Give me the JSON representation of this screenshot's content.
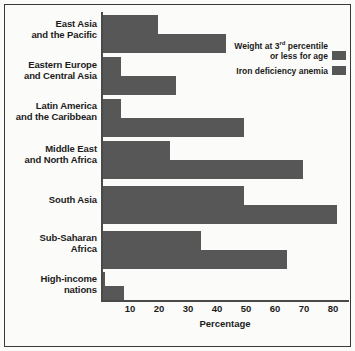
{
  "chart_data": {
    "type": "bar",
    "orientation": "horizontal",
    "title": "",
    "xlabel": "Percentage",
    "ylabel": "",
    "xlim": [
      0,
      80
    ],
    "xticks": [
      10,
      20,
      30,
      40,
      50,
      60,
      70,
      80
    ],
    "grid": false,
    "legend_position": "top-right",
    "bar_color": "#575757",
    "categories": [
      "East Asia and the Pacific",
      "Eastern Europe and Central Asia",
      "Latin America and the Caribbean",
      "Middle East and North Africa",
      "South Asia",
      "Sub-Saharan Africa",
      "High-income nations"
    ],
    "category_lines": [
      [
        "East Asia",
        "and the Pacific"
      ],
      [
        "Eastern Europe",
        "and Central Asia"
      ],
      [
        "Latin America",
        "and the Caribbean"
      ],
      [
        "Middle East",
        "and North Africa"
      ],
      [
        "South Asia"
      ],
      [
        "Sub-Saharan",
        "Africa"
      ],
      [
        "High-income",
        "nations"
      ]
    ],
    "series": [
      {
        "name": "Weight at 3rd percentile or less for age",
        "name_parts": [
          "Weight at 3",
          "rd",
          " percentile",
          "or less for age"
        ],
        "color": "#575757",
        "values": [
          18,
          6,
          6,
          22,
          46,
          32,
          1
        ]
      },
      {
        "name": "Iron deficiency anemia",
        "color": "#575757",
        "values": [
          40,
          24,
          46,
          65,
          76,
          60,
          7
        ]
      }
    ]
  },
  "legend": {
    "items": [
      {
        "label_line1": "Weight at 3",
        "sup": "rd",
        "label_line1_rest": " percentile",
        "label_line2": "or less for age"
      },
      {
        "label_line1": "Iron deficiency anemia",
        "sup": "",
        "label_line1_rest": "",
        "label_line2": ""
      }
    ]
  },
  "axis": {
    "xlabel": "Percentage",
    "tick_0": "10",
    "tick_1": "20",
    "tick_2": "30",
    "tick_3": "40",
    "tick_4": "50",
    "tick_5": "60",
    "tick_6": "70",
    "tick_7": "80"
  },
  "categories_display": {
    "c0_l1": "East Asia",
    "c0_l2": "and the Pacific",
    "c1_l1": "Eastern Europe",
    "c1_l2": "and Central Asia",
    "c2_l1": "Latin America",
    "c2_l2": "and the Caribbean",
    "c3_l1": "Middle East",
    "c3_l2": "and North Africa",
    "c4_l1": "South Asia",
    "c4_l2": "",
    "c5_l1": "Sub-Saharan",
    "c5_l2": "Africa",
    "c6_l1": "High-income",
    "c6_l2": "nations"
  }
}
